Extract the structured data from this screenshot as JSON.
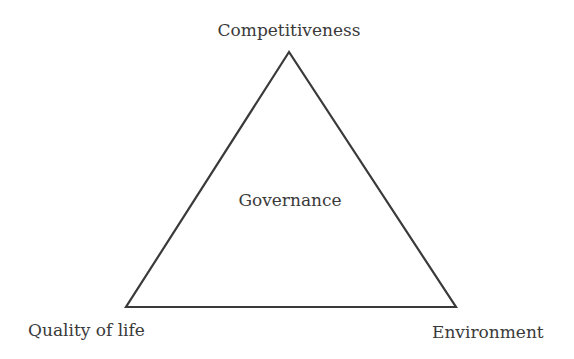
{
  "diagram": {
    "type": "triangle",
    "stroke_color": "#3a3a3a",
    "background": "#ffffff",
    "vertices": {
      "top": {
        "label": "Competitiveness"
      },
      "bottom_left": {
        "label": "Quality of life"
      },
      "bottom_right": {
        "label": "Environment"
      }
    },
    "center": {
      "label": "Governance"
    }
  }
}
